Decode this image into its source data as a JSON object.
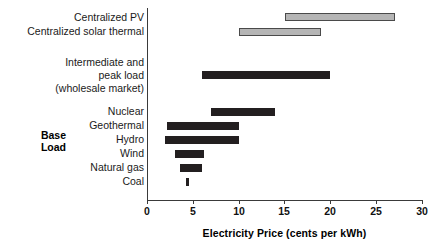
{
  "chart_data": {
    "type": "bar",
    "orientation": "horizontal",
    "subtype": "range-bar",
    "title": "",
    "xlabel": "Electricity Price (cents per kWh)",
    "ylabel": "",
    "xlim": [
      0,
      30
    ],
    "xticks": [
      0,
      5,
      10,
      15,
      20,
      25,
      30
    ],
    "grid": false,
    "legend": null,
    "categories": [
      "Centralized PV",
      "Centralized solar thermal",
      "Intermediate and peak load (wholesale market)",
      "Nuclear",
      "Geothermal",
      "Hydro",
      "Wind",
      "Natural gas",
      "Coal"
    ],
    "ranges": [
      {
        "label": "Centralized PV",
        "low": 15.0,
        "high": 27.0,
        "color": "#b5b5b5"
      },
      {
        "label": "Centralized solar thermal",
        "low": 10.0,
        "high": 19.0,
        "color": "#b5b5b5"
      },
      {
        "label": "Intermediate and peak load (wholesale market)",
        "low": 6.0,
        "high": 20.0,
        "color": "#231f20"
      },
      {
        "label": "Nuclear",
        "low": 7.0,
        "high": 14.0,
        "color": "#231f20"
      },
      {
        "label": "Geothermal",
        "low": 2.2,
        "high": 10.0,
        "color": "#231f20"
      },
      {
        "label": "Hydro",
        "low": 2.0,
        "high": 10.0,
        "color": "#231f20"
      },
      {
        "label": "Wind",
        "low": 3.0,
        "high": 6.2,
        "color": "#231f20"
      },
      {
        "label": "Natural gas",
        "low": 3.6,
        "high": 6.0,
        "color": "#231f20"
      },
      {
        "label": "Coal",
        "low": 4.2,
        "high": 4.5,
        "color": "#231f20"
      }
    ]
  },
  "labels": {
    "centralized_pv": "Centralized PV",
    "centralized_solar_thermal": "Centralized solar thermal",
    "intermediate_line1": "Intermediate and",
    "intermediate_line2": "peak load",
    "intermediate_line3": "(wholesale market)",
    "nuclear": "Nuclear",
    "geothermal": "Geothermal",
    "hydro": "Hydro",
    "wind": "Wind",
    "natural_gas": "Natural gas",
    "coal": "Coal",
    "group_line1": "Base",
    "group_line2": "Load"
  },
  "axis": {
    "title": "Electricity Price (cents per kWh)",
    "ticks": [
      "0",
      "5",
      "10",
      "15",
      "20",
      "25",
      "30"
    ]
  },
  "colors": {
    "dark_bar": "#231f20",
    "gray_bar": "#b5b5b5",
    "gray_bar_outline": "#4a4a4a",
    "axis": "#3a3a3a",
    "text": "#1a1a1a"
  }
}
